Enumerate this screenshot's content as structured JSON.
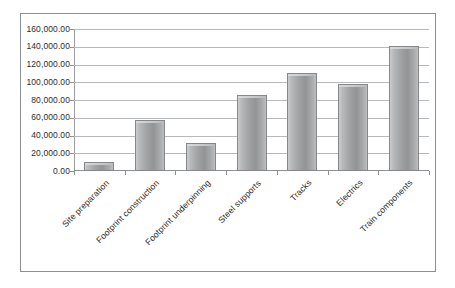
{
  "chart_data": {
    "type": "bar",
    "title": "",
    "subtitle": "",
    "xlabel": "",
    "ylabel": "",
    "categories": [
      "Site preparation",
      "Footprint construction",
      "Footprint underpinning",
      "Steel supports",
      "Tracks",
      "Electrics",
      "Train components"
    ],
    "values": [
      10000,
      57000,
      32000,
      85500,
      111000,
      98000,
      141000
    ],
    "ylim": [
      0,
      160000
    ],
    "ytick_step": 20000,
    "ytick_labels": [
      "0.00",
      "20,000.00",
      "40,000.00",
      "60,000.00",
      "80,000.00",
      "100,000.00",
      "120,000.00",
      "140,000.00",
      "160,000.00"
    ],
    "grid": true,
    "legend": false,
    "legend_position": "none",
    "series": [
      {
        "name": "",
        "values": [
          10000,
          57000,
          32000,
          85500,
          111000,
          98000,
          141000
        ]
      }
    ],
    "bar_color": "#9fa1a3",
    "bar_border_color": "#85878a",
    "grid_color": "#b7b9bb",
    "axis_color": "#8e9093",
    "text_color": "#2c2c2c",
    "plot_background": "#ffffff",
    "frame_border_color": "#8c8f93"
  }
}
